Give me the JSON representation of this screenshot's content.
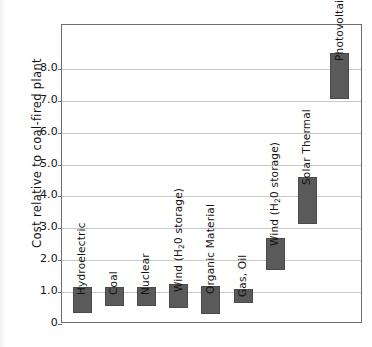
{
  "chart_data": {
    "type": "bar",
    "title": "",
    "subtitle": "",
    "xlabel": "",
    "ylabel": "Cost relative to coal-fired plant",
    "ylim": [
      0,
      9.0
    ],
    "yticks": [
      "0",
      "1.0",
      "2.0",
      "3.0",
      "4.0",
      "5.0",
      "6.0",
      "7.0",
      "8.0"
    ],
    "ytick_values": [
      0,
      1.0,
      2.0,
      3.0,
      4.0,
      5.0,
      6.0,
      7.0,
      8.0
    ],
    "grid": true,
    "legend": "none",
    "bar_style": "floating range bars (low-high cost band)",
    "categories": [
      "Hydroelectric",
      "Coal",
      "Nuclear",
      "Wind (H₂0 storage)",
      "Organic Material",
      "Gas, Oil",
      "Wind (H₂0 storage)",
      "Solar Thermal",
      "Photovoltaic"
    ],
    "bars": [
      {
        "label": "Hydroelectric",
        "label_main": "Hydroelectric",
        "label_sub": "",
        "label_tail": "",
        "low": 0.35,
        "high": 1.15
      },
      {
        "label": "Coal",
        "label_main": "Coal",
        "label_sub": "",
        "label_tail": "",
        "low": 0.55,
        "high": 1.15
      },
      {
        "label": "Nuclear",
        "label_main": "Nuclear",
        "label_sub": "",
        "label_tail": "",
        "low": 0.55,
        "high": 1.15
      },
      {
        "label": "Wind (H20 storage)",
        "label_main": "Wind (H",
        "label_sub": "2",
        "label_tail": "0 storage)",
        "low": 0.5,
        "high": 1.25
      },
      {
        "label": "Organic Material",
        "label_main": "Organic Material",
        "label_sub": "",
        "label_tail": "",
        "low": 0.3,
        "high": 1.2
      },
      {
        "label": "Gas, Oil",
        "label_main": "Gas, Oil",
        "label_sub": "",
        "label_tail": "",
        "low": 0.65,
        "high": 1.1
      },
      {
        "label": "Wind (H20 storage)",
        "label_main": "Wind (H",
        "label_sub": "2",
        "label_tail": "0 storage)",
        "low": 1.7,
        "high": 2.7
      },
      {
        "label": "Solar Thermal",
        "label_main": "Solar Thermal",
        "label_sub": "",
        "label_tail": "",
        "low": 3.15,
        "high": 4.6
      },
      {
        "label": "Photovoltaic",
        "label_main": "Photovoltaic",
        "label_sub": "",
        "label_tail": "",
        "low": 7.05,
        "high": 8.5
      }
    ],
    "colors": {
      "bar_fill": "#5a5a5a",
      "bar_stroke": "#4a4a4a",
      "gridline": "#c9c9c9",
      "axis": "#6d6d6d",
      "text": "#141414",
      "background": "#ffffff"
    }
  }
}
